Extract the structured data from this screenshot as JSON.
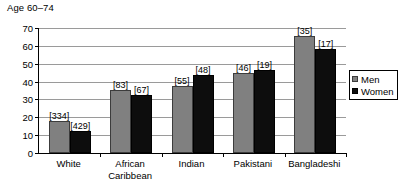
{
  "chart_data": {
    "type": "bar",
    "title": "Age 60–74",
    "xlabel": "",
    "ylabel": "",
    "ylim": [
      0,
      70
    ],
    "yticks": [
      0,
      10,
      20,
      30,
      40,
      50,
      60,
      70
    ],
    "ytick_labels": [
      "0",
      "10",
      "20",
      "30",
      "40",
      "50",
      "60",
      "70"
    ],
    "grid": true,
    "legend_position": "right",
    "categories": [
      "White",
      "African\nCaribbean",
      "Indian",
      "Pakistani",
      "Bangladeshi"
    ],
    "series": [
      {
        "name": "Men",
        "color": "#808080",
        "values": [
          18,
          35.5,
          37.5,
          45,
          65.5
        ],
        "annotations": [
          "[334]",
          "[83]",
          "[55]",
          "[46]",
          "[35]"
        ]
      },
      {
        "name": "Women",
        "color": "#0d0d0d",
        "values": [
          12.5,
          32.5,
          43.5,
          46.5,
          58.5
        ],
        "annotations": [
          "[429]",
          "[67]",
          "[48]",
          "[19]",
          "[17]"
        ]
      }
    ]
  },
  "legend": {
    "items": [
      {
        "label": "Men",
        "swatch": "men"
      },
      {
        "label": "Women",
        "swatch": "women"
      }
    ]
  }
}
